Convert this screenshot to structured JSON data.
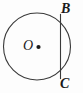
{
  "figure": {
    "kind": "geometry-diagram",
    "background_color": "#fdfdfd",
    "stroke_color": "#3a3a3a",
    "stroke_width": 1,
    "width": 83,
    "height": 93
  },
  "circle": {
    "label": "circle",
    "center_x": 37,
    "center_y": 46.5,
    "radius": 33.5
  },
  "center_point": {
    "label": "center-dot",
    "x": 38.5,
    "y": 47,
    "radius": 2.1,
    "fill": "#1a1a1a"
  },
  "chord": {
    "label": "chord BC",
    "x": 60.5,
    "y1": 13.9,
    "y2": 79.1
  },
  "labels": {
    "B": "B",
    "C": "C",
    "O": "O"
  }
}
